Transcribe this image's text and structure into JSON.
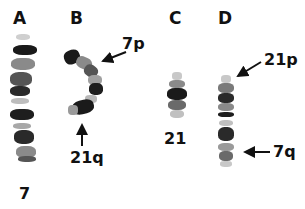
{
  "figure": {
    "panels": [
      {
        "id": "A",
        "label": "A",
        "chromosome_label": "7"
      },
      {
        "id": "B",
        "label": "B",
        "annotations": [
          "7p",
          "21q"
        ]
      },
      {
        "id": "C",
        "label": "C",
        "chromosome_label": "21"
      },
      {
        "id": "D",
        "label": "D",
        "annotations": [
          "21p",
          "7q"
        ]
      }
    ],
    "labels": {
      "A": "A",
      "B": "B",
      "C": "C",
      "D": "D",
      "chr7": "7",
      "chr21": "21",
      "b_7p": "7p",
      "b_21q": "21q",
      "d_21p": "21p",
      "d_7q": "7q"
    },
    "colors": {
      "background": "#ffffff",
      "text": "#111111",
      "dark_band": "#1a1a1a",
      "mid_band": "#6a6a6a",
      "light_band": "#b8b8b8"
    }
  }
}
